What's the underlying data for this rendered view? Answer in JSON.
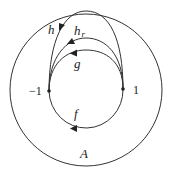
{
  "diagram": {
    "region_label": "A",
    "points": [
      {
        "label": "−1",
        "x": 49,
        "y": 91
      },
      {
        "label": "1",
        "x": 123,
        "y": 89
      }
    ],
    "paths": [
      {
        "name": "f",
        "label": "f",
        "direction": "right-to-left along lower arc"
      },
      {
        "name": "g",
        "label": "g",
        "direction": "1 to -1 along upper arc"
      },
      {
        "name": "h_r",
        "label": "h",
        "subscript": "r",
        "direction": "1 to -1 along higher arc"
      },
      {
        "name": "h",
        "label": "h",
        "direction": "1 to -1 along outermost arc touching outer boundary"
      }
    ],
    "colors": {
      "stroke": "#333333",
      "background": "#ffffff"
    }
  }
}
